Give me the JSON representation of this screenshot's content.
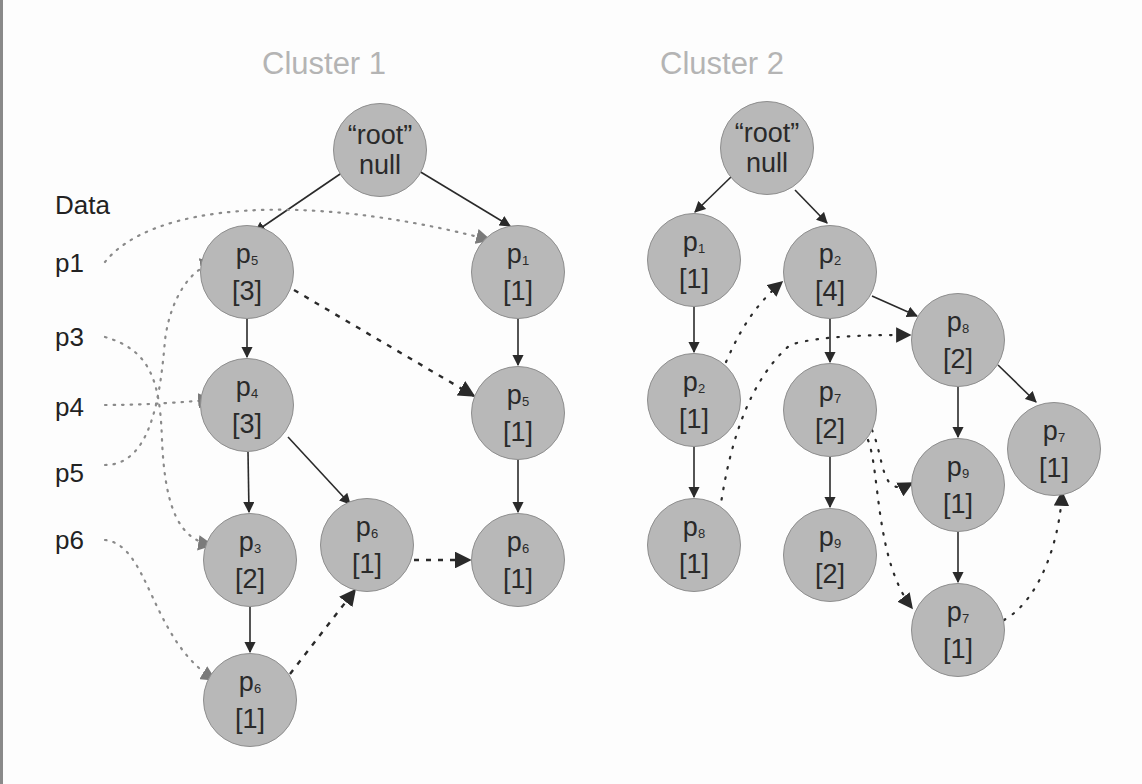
{
  "data_column": {
    "header": "Data",
    "items": [
      "p1",
      "p3",
      "p4",
      "p5",
      "p6"
    ]
  },
  "clusters": [
    {
      "title": "Cluster 1",
      "nodes": [
        {
          "id": "c1-root",
          "line1": "“root”",
          "line2": "null"
        },
        {
          "id": "c1-p5-3",
          "base": "p",
          "sub": "5",
          "count": "[3]"
        },
        {
          "id": "c1-p1-1",
          "base": "p",
          "sub": "1",
          "count": "[1]"
        },
        {
          "id": "c1-p4-3",
          "base": "p",
          "sub": "4",
          "count": "[3]"
        },
        {
          "id": "c1-p5-1",
          "base": "p",
          "sub": "5",
          "count": "[1]"
        },
        {
          "id": "c1-p3-2",
          "base": "p",
          "sub": "3",
          "count": "[2]"
        },
        {
          "id": "c1-p6-1a",
          "base": "p",
          "sub": "6",
          "count": "[1]"
        },
        {
          "id": "c1-p6-1b",
          "base": "p",
          "sub": "6",
          "count": "[1]"
        },
        {
          "id": "c1-p6-1c",
          "base": "p",
          "sub": "6",
          "count": "[1]"
        }
      ]
    },
    {
      "title": "Cluster 2",
      "nodes": [
        {
          "id": "c2-root",
          "line1": "“root”",
          "line2": "null"
        },
        {
          "id": "c2-p1-1",
          "base": "p",
          "sub": "1",
          "count": "[1]"
        },
        {
          "id": "c2-p2-4",
          "base": "p",
          "sub": "2",
          "count": "[4]"
        },
        {
          "id": "c2-p2-1",
          "base": "p",
          "sub": "2",
          "count": "[1]"
        },
        {
          "id": "c2-p7-2",
          "base": "p",
          "sub": "7",
          "count": "[2]"
        },
        {
          "id": "c2-p8-2",
          "base": "p",
          "sub": "8",
          "count": "[2]"
        },
        {
          "id": "c2-p8-1",
          "base": "p",
          "sub": "8",
          "count": "[1]"
        },
        {
          "id": "c2-p9-2",
          "base": "p",
          "sub": "9",
          "count": "[2]"
        },
        {
          "id": "c2-p9-1",
          "base": "p",
          "sub": "9",
          "count": "[1]"
        },
        {
          "id": "c2-p7-1a",
          "base": "p",
          "sub": "7",
          "count": "[1]"
        },
        {
          "id": "c2-p7-1b",
          "base": "p",
          "sub": "7",
          "count": "[1]"
        }
      ]
    }
  ],
  "colors": {
    "node_fill": "#b8b8b8",
    "node_border": "#8e8e8e",
    "edge": "#2a2a2a",
    "title": "#b4b4b4",
    "data_link": "#8a8a8a"
  }
}
